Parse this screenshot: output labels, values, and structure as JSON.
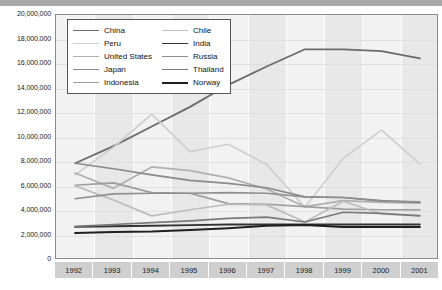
{
  "chart_data": {
    "type": "line",
    "title": "",
    "xlabel": "",
    "ylabel": "",
    "categories": [
      "1992",
      "1993",
      "1994",
      "1995",
      "1996",
      "1997",
      "1998",
      "1999",
      "2000",
      "2001"
    ],
    "x": [
      1992,
      1993,
      1994,
      1995,
      1996,
      1997,
      1998,
      1999,
      2000,
      2001
    ],
    "ylim": [
      0,
      20000000
    ],
    "ytick_labels": [
      "20,000,000",
      "18,000,000",
      "16,000,000",
      "14,000,000",
      "12,000,000",
      "10,000,000",
      "8,000,000",
      "6,000,000",
      "4,000,000",
      "2,000,000",
      "0"
    ],
    "ytick_values": [
      20000000,
      18000000,
      16000000,
      14000000,
      12000000,
      10000000,
      8000000,
      6000000,
      4000000,
      2000000,
      0
    ],
    "grid": true,
    "legend_position": "top-left",
    "series": [
      {
        "name": "China",
        "color": "#6b6b6b",
        "width": 1.8,
        "values": [
          7900000,
          9300000,
          10900000,
          12500000,
          14300000,
          15800000,
          17200000,
          17200000,
          17050000,
          16450000
        ]
      },
      {
        "name": "Peru",
        "color": "#cfcfcf",
        "width": 1.7,
        "values": [
          6950000,
          9200000,
          11900000,
          8850000,
          9450000,
          7800000,
          4300000,
          8300000,
          10600000,
          7850000
        ]
      },
      {
        "name": "United States",
        "color": "#b0b0b0",
        "width": 1.7,
        "values": [
          7100000,
          5850000,
          7600000,
          7300000,
          6700000,
          5800000,
          4350000,
          4850000,
          4700000,
          4650000
        ]
      },
      {
        "name": "Japan",
        "color": "#8a8a8a",
        "width": 1.7,
        "values": [
          7900000,
          7450000,
          6950000,
          6500000,
          6250000,
          5900000,
          5150000,
          5100000,
          4850000,
          4700000
        ]
      },
      {
        "name": "Indonesia",
        "color": "#9e9e9e",
        "width": 1.7,
        "values": [
          6100000,
          6300000,
          5500000,
          5450000,
          4600000,
          4550000,
          4350000,
          4150000,
          4100000,
          4100000
        ]
      },
      {
        "name": "Chile",
        "color": "#bdbdbd",
        "width": 1.7,
        "values": [
          6050000,
          4900000,
          3600000,
          4100000,
          4550000,
          4500000,
          3100000,
          4800000,
          3750000,
          3650000
        ]
      },
      {
        "name": "India",
        "color": "#333333",
        "width": 1.9,
        "values": [
          2700000,
          2750000,
          2800000,
          2850000,
          2900000,
          2900000,
          2900000,
          2900000,
          2900000,
          2900000
        ]
      },
      {
        "name": "Russia",
        "color": "#8f8f8f",
        "width": 1.7,
        "values": [
          5000000,
          5400000,
          5450000,
          5450000,
          5500000,
          5450000,
          5150000,
          5100000,
          4800000,
          4750000
        ]
      },
      {
        "name": "Thailand",
        "color": "#7a7a7a",
        "width": 1.7,
        "values": [
          2750000,
          2900000,
          3050000,
          3200000,
          3400000,
          3500000,
          3100000,
          3900000,
          3800000,
          3600000
        ]
      },
      {
        "name": "Norway",
        "color": "#1f1f1f",
        "width": 2.0,
        "values": [
          2200000,
          2280000,
          2320000,
          2450000,
          2600000,
          2800000,
          2850000,
          2700000,
          2700000,
          2700000
        ]
      }
    ]
  },
  "legend": {
    "entries": [
      {
        "label": "China"
      },
      {
        "label": "Chile"
      },
      {
        "label": "Peru"
      },
      {
        "label": "India"
      },
      {
        "label": "United States"
      },
      {
        "label": "Russia"
      },
      {
        "label": "Japan"
      },
      {
        "label": "Thailand"
      },
      {
        "label": "Indonesia"
      },
      {
        "label": "Norway"
      }
    ]
  },
  "colors": {
    "plot_background": "#f2f2f2",
    "band": "#e8e8e8",
    "axis": "#8c8c8c",
    "tick_box": "#cfcfcf",
    "top_bar": "#a8a8a8",
    "text": "#1a1a1a"
  }
}
